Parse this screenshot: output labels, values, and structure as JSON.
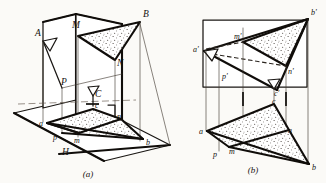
{
  "figure": {
    "ink_color": "#100d0a",
    "paper_color": "#fbfaf7",
    "panels": [
      {
        "id": "a",
        "caption": "(a)",
        "description": "Pictorial view: triangle ABC in space with vertical plane V and horizontal plane H, showing projectors to horizontal traces a, b, c and auxiliary points M, N, P.",
        "plane_label": "H",
        "space_labels": [
          {
            "text": "A",
            "x": 35,
            "y": 36
          },
          {
            "text": "M",
            "x": 76,
            "y": 27
          },
          {
            "text": "B",
            "x": 143,
            "y": 17
          },
          {
            "text": "N",
            "x": 117,
            "y": 63
          },
          {
            "text": "P",
            "x": 62,
            "y": 83
          },
          {
            "text": "C",
            "x": 94,
            "y": 94
          }
        ],
        "trace_labels": [
          {
            "text": "a",
            "x": 40,
            "y": 126
          },
          {
            "text": "p",
            "x": 53,
            "y": 138
          },
          {
            "text": "m",
            "x": 77,
            "y": 141
          },
          {
            "text": "c",
            "x": 96,
            "y": 112
          },
          {
            "text": "n",
            "x": 118,
            "y": 122
          },
          {
            "text": "b",
            "x": 145,
            "y": 144
          },
          {
            "text": "H",
            "x": 63,
            "y": 152
          }
        ]
      },
      {
        "id": "b",
        "caption": "(b)",
        "description": "Two-view orthographic drawing: frontal projection a'b'c' above with m', n', p' and horizontal projection abc below with m, n, p, joined by vertical projection lines.",
        "frontal_labels": [
          {
            "text": "a'",
            "x": 196,
            "y": 52
          },
          {
            "text": "m'",
            "x": 237,
            "y": 38
          },
          {
            "text": "b'",
            "x": 312,
            "y": 14
          },
          {
            "text": "n'",
            "x": 290,
            "y": 71
          },
          {
            "text": "p'",
            "x": 228,
            "y": 77
          },
          {
            "text": "c'",
            "x": 271,
            "y": 94
          }
        ],
        "horizontal_labels": [
          {
            "text": "c",
            "x": 272,
            "y": 107
          },
          {
            "text": "a",
            "x": 202,
            "y": 135
          },
          {
            "text": "n",
            "x": 288,
            "y": 134
          },
          {
            "text": "p",
            "x": 215,
            "y": 155
          },
          {
            "text": "m",
            "x": 232,
            "y": 152
          },
          {
            "text": "b",
            "x": 312,
            "y": 168
          }
        ]
      }
    ],
    "captions": [
      {
        "text": "(a)",
        "x": 88,
        "y": 176
      },
      {
        "text": "(b)",
        "x": 253,
        "y": 172
      }
    ]
  }
}
